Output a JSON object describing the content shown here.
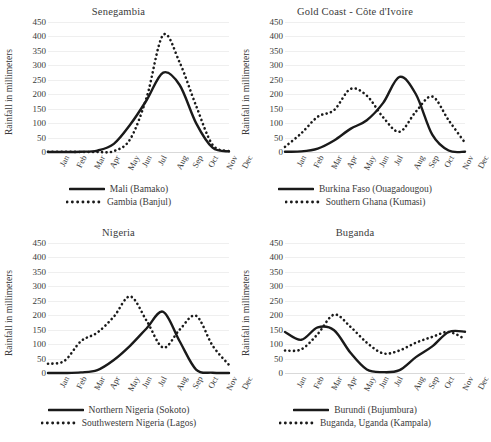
{
  "figure": {
    "ylabel": "Rainfall in millimeters",
    "months": [
      "Jan",
      "Feb",
      "Mar",
      "Apr",
      "May",
      "Jun",
      "Jul",
      "Aug",
      "Sep",
      "Oct",
      "Nov",
      "Dec"
    ],
    "yticks": [
      0,
      50,
      100,
      150,
      200,
      250,
      300,
      350,
      400,
      450
    ],
    "ylim": [
      0,
      450
    ],
    "series_color": "#1a1a1a",
    "gridline_color": "#efefef"
  },
  "chart_data": [
    {
      "type": "line",
      "title": "Senegambia",
      "xlabel": "",
      "ylabel": "Rainfall in millimeters",
      "ylim": [
        0,
        450
      ],
      "categories": [
        "Jan",
        "Feb",
        "Mar",
        "Apr",
        "May",
        "Jun",
        "Jul",
        "Aug",
        "Sep",
        "Oct",
        "Nov",
        "Dec"
      ],
      "legend_position": "bottom",
      "grid": true,
      "series": [
        {
          "name": "Mali (Bamako)",
          "style": "solid",
          "values": [
            0,
            0,
            1,
            5,
            28,
            95,
            180,
            275,
            232,
            100,
            15,
            2
          ]
        },
        {
          "name": "Gambia (Banjul)",
          "style": "dotted",
          "values": [
            1,
            1,
            0,
            0,
            3,
            45,
            190,
            405,
            310,
            160,
            25,
            3
          ]
        }
      ]
    },
    {
      "type": "line",
      "title": "Gold Coast - Côte d'Ivoire",
      "xlabel": "",
      "ylabel": "Rainfall in millimeters",
      "ylim": [
        0,
        450
      ],
      "categories": [
        "Jan",
        "Feb",
        "Mar",
        "Apr",
        "May",
        "Jun",
        "Jul",
        "Aug",
        "Sep",
        "Oct",
        "Nov",
        "Dec"
      ],
      "legend_position": "bottom",
      "grid": true,
      "series": [
        {
          "name": "Burkina Faso (Ouagadougou)",
          "style": "solid",
          "values": [
            1,
            2,
            12,
            40,
            80,
            110,
            170,
            260,
            200,
            60,
            5,
            1
          ]
        },
        {
          "name": "Southern Ghana (Kumasi)",
          "style": "dotted",
          "values": [
            18,
            65,
            122,
            145,
            218,
            195,
            120,
            70,
            140,
            192,
            110,
            32
          ]
        }
      ]
    },
    {
      "type": "line",
      "title": "Nigeria",
      "xlabel": "",
      "ylabel": "Rainfall in millimeters",
      "ylim": [
        0,
        450
      ],
      "categories": [
        "Jan",
        "Feb",
        "Mar",
        "Apr",
        "May",
        "Jun",
        "Jul",
        "Aug",
        "Sep",
        "Oct",
        "Nov",
        "Dec"
      ],
      "legend_position": "bottom",
      "grid": true,
      "series": [
        {
          "name": "Northern Nigeria (Sokoto)",
          "style": "solid",
          "values": [
            0,
            0,
            2,
            10,
            45,
            95,
            155,
            212,
            110,
            12,
            1,
            0
          ]
        },
        {
          "name": "Southwestern Nigeria (Lagos)",
          "style": "dotted",
          "values": [
            32,
            42,
            110,
            140,
            195,
            265,
            180,
            88,
            150,
            198,
            95,
            28
          ]
        }
      ]
    },
    {
      "type": "line",
      "title": "Buganda",
      "xlabel": "",
      "ylabel": "Rainfall in millimeters",
      "ylim": [
        0,
        450
      ],
      "categories": [
        "Jan",
        "Feb",
        "Mar",
        "Apr",
        "May",
        "Jun",
        "Jul",
        "Aug",
        "Sep",
        "Oct",
        "Nov",
        "Dec"
      ],
      "legend_position": "bottom",
      "grid": true,
      "series": [
        {
          "name": "Burundi (Bujumbura)",
          "style": "solid",
          "values": [
            142,
            115,
            158,
            148,
            70,
            12,
            3,
            10,
            55,
            92,
            142,
            143
          ]
        },
        {
          "name": "Buganda, Uganda (Kampala)",
          "style": "dotted",
          "values": [
            78,
            82,
            135,
            202,
            160,
            105,
            68,
            78,
            105,
            125,
            142,
            118
          ]
        }
      ]
    }
  ]
}
